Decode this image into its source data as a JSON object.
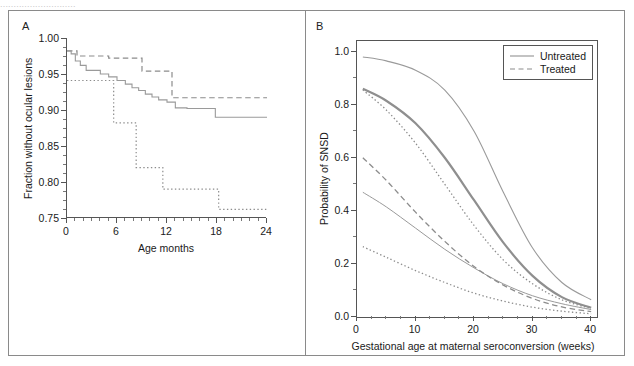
{
  "figure": {
    "cropped_caption_sliver": "............................",
    "background": "#ffffff",
    "frame_color": "#8a8a8a"
  },
  "panel_a": {
    "letter": "A",
    "ylabel": "Fraction without ocular lesions",
    "xlabel": "Age months",
    "chart_data": {
      "type": "line",
      "title": "",
      "xlabel": "Age months",
      "ylabel": "Fraction without ocular lesions",
      "xlim": [
        0,
        24
      ],
      "ylim": [
        0.75,
        1.0
      ],
      "xticks": [
        0,
        6,
        12,
        18,
        24
      ],
      "yticks": [
        0.75,
        0.8,
        0.85,
        0.9,
        0.95,
        1.0
      ],
      "ytick_labels": [
        "0.75",
        "0.80",
        "0.85",
        "0.90",
        "0.95",
        "1.00"
      ],
      "xtick_labels": [
        "0",
        "6",
        "12",
        "18",
        "24"
      ],
      "x_minor_step": 1,
      "y_minor_step": 0.0125,
      "grid": false,
      "legend": "none",
      "step_style": "post",
      "series": [
        {
          "name": "Group 1 (dashed)",
          "style": "dashed",
          "color": "#8c8c8c",
          "width": 1.2,
          "x": [
            0,
            0.6,
            1.2,
            3.1,
            5.0,
            7.4,
            9.0,
            10.9,
            12.6,
            24
          ],
          "values": [
            0.982,
            0.982,
            0.975,
            0.975,
            0.972,
            0.972,
            0.954,
            0.954,
            0.917,
            0.917
          ]
        },
        {
          "name": "Group 2 (solid)",
          "style": "solid",
          "color": "#9a9a9a",
          "width": 1.1,
          "x": [
            0,
            0.5,
            1.0,
            1.6,
            2.3,
            3.0,
            4.0,
            5.0,
            6.0,
            7.0,
            7.8,
            8.6,
            9.4,
            10.2,
            11.0,
            12.0,
            13.0,
            14.4,
            17.8,
            24
          ],
          "values": [
            0.982,
            0.978,
            0.968,
            0.962,
            0.955,
            0.955,
            0.95,
            0.946,
            0.941,
            0.936,
            0.931,
            0.927,
            0.922,
            0.918,
            0.914,
            0.911,
            0.903,
            0.902,
            0.89,
            0.89
          ]
        },
        {
          "name": "Group 3 (dotted)",
          "style": "dotted",
          "color": "#8c8c8c",
          "width": 1.2,
          "x": [
            0,
            4.9,
            5.6,
            7.6,
            8.3,
            10.8,
            11.5,
            17.5,
            18.2,
            24
          ],
          "values": [
            0.941,
            0.941,
            0.882,
            0.882,
            0.82,
            0.82,
            0.79,
            0.79,
            0.762,
            0.762
          ]
        }
      ]
    }
  },
  "panel_b": {
    "letter": "B",
    "ylabel": "Probability of SNSD",
    "xlabel": "Gestational age at maternal seroconversion (weeks)",
    "legend": {
      "items": [
        {
          "label": "Untreated",
          "style": "solid"
        },
        {
          "label": "Treated",
          "style": "dashed"
        }
      ]
    },
    "chart_data": {
      "type": "line",
      "title": "",
      "xlabel": "Gestational age at maternal seroconversion (weeks)",
      "ylabel": "Probability of SNSD",
      "xlim": [
        0,
        41
      ],
      "ylim": [
        0.0,
        1.04
      ],
      "xticks": [
        0,
        10,
        20,
        30,
        40
      ],
      "yticks": [
        0.0,
        0.2,
        0.4,
        0.6,
        0.8,
        1.0
      ],
      "xtick_labels": [
        "0",
        "10",
        "20",
        "30",
        "40"
      ],
      "ytick_labels": [
        "0.0",
        "0.2",
        "0.4",
        "0.6",
        "0.8",
        "1.0"
      ],
      "x_minor_step": 2.5,
      "y_minor_step": 0.1,
      "grid": false,
      "legend_position": "top-right",
      "x": [
        1,
        5,
        10,
        15,
        20,
        25,
        30,
        35,
        40
      ],
      "series": [
        {
          "name": "Untreated upper",
          "style": "solid",
          "color": "#9a9a9a",
          "width": 1.1,
          "values": [
            0.98,
            0.965,
            0.93,
            0.855,
            0.7,
            0.47,
            0.26,
            0.13,
            0.065
          ]
        },
        {
          "name": "Untreated central",
          "style": "solid",
          "color": "#8f8f8f",
          "width": 2.2,
          "values": [
            0.86,
            0.815,
            0.73,
            0.6,
            0.44,
            0.28,
            0.155,
            0.075,
            0.035
          ]
        },
        {
          "name": "Untreated lower",
          "style": "solid",
          "color": "#9a9a9a",
          "width": 1.0,
          "values": [
            0.47,
            0.415,
            0.335,
            0.255,
            0.185,
            0.125,
            0.08,
            0.05,
            0.028
          ]
        },
        {
          "name": "Treated upper (fine dotted)",
          "style": "dotted",
          "color": "#8c8c8c",
          "width": 1.3,
          "values": [
            0.855,
            0.78,
            0.655,
            0.5,
            0.345,
            0.215,
            0.125,
            0.065,
            0.032
          ]
        },
        {
          "name": "Treated central (dashed)",
          "style": "dashed",
          "color": "#8c8c8c",
          "width": 1.3,
          "values": [
            0.6,
            0.515,
            0.395,
            0.285,
            0.19,
            0.12,
            0.07,
            0.038,
            0.02
          ]
        },
        {
          "name": "Treated lower (dotted)",
          "style": "dotted",
          "color": "#8c8c8c",
          "width": 1.3,
          "values": [
            0.265,
            0.225,
            0.175,
            0.13,
            0.09,
            0.06,
            0.037,
            0.022,
            0.012
          ]
        }
      ]
    }
  }
}
